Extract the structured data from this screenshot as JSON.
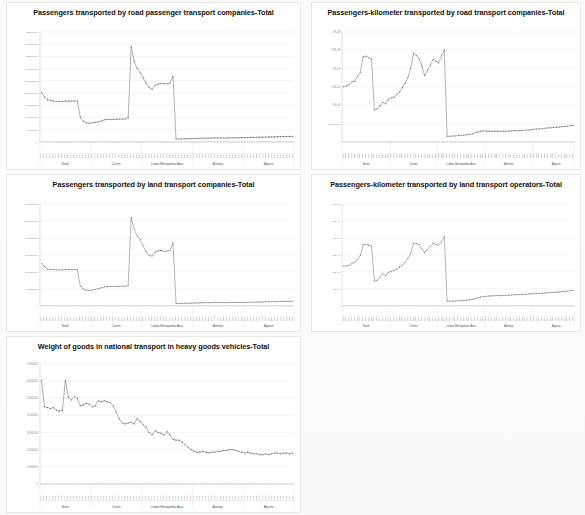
{
  "page": {
    "background_color": "#fbfbfa",
    "layout": "2-column grid of line charts, 5 charts total"
  },
  "regions": [
    "North",
    "Centro",
    "Lisbon Metropolitan Area",
    "Alentejo",
    "Algarve"
  ],
  "years": [
    "2002",
    "2003",
    "2004",
    "2005",
    "2006",
    "2007",
    "2008",
    "2009",
    "2010",
    "2011",
    "2012",
    "2013",
    "2014",
    "2015",
    "2016",
    "2017",
    "2018"
  ],
  "chart_data": [
    {
      "id": "chart-1",
      "type": "line",
      "title": "Passengers transported by road passenger transport companies-Total",
      "xlabel": "",
      "ylabel": "",
      "grid": true,
      "legend": "none",
      "series_color": "#6b6b6b",
      "ylim": [
        0,
        450000000
      ],
      "ytick_labels": [
        "0",
        "50000000",
        "100000000",
        "150000000",
        "200000000",
        "250000000",
        "300000000",
        "350000000",
        "400000000",
        "450000000"
      ],
      "ytick_values": [
        0,
        50000000,
        100000000,
        150000000,
        200000000,
        250000000,
        300000000,
        350000000,
        400000000,
        450000000
      ],
      "group_labels": [
        "North",
        "Centro",
        "Lisbon Metropolitan Area",
        "Alentejo",
        "Algarve"
      ],
      "x": [
        "2002",
        "2003",
        "2004",
        "2005",
        "2006",
        "2007",
        "2008",
        "2009",
        "2010",
        "2011",
        "2012",
        "2013",
        "2014",
        "2015",
        "2016",
        "2017",
        "2018",
        "2002",
        "2003",
        "2004",
        "2005",
        "2006",
        "2007",
        "2008",
        "2009",
        "2010",
        "2011",
        "2012",
        "2013",
        "2014",
        "2015",
        "2016",
        "2017",
        "2018",
        "2002",
        "2003",
        "2004",
        "2005",
        "2006",
        "2007",
        "2008",
        "2009",
        "2010",
        "2011",
        "2012",
        "2013",
        "2014",
        "2015",
        "2016",
        "2017",
        "2018",
        "2002",
        "2003",
        "2004",
        "2005",
        "2006",
        "2007",
        "2008",
        "2009",
        "2010",
        "2011",
        "2012",
        "2013",
        "2014",
        "2015",
        "2016",
        "2017",
        "2018",
        "2002",
        "2003",
        "2004",
        "2005",
        "2006",
        "2007",
        "2008",
        "2009",
        "2010",
        "2011",
        "2012",
        "2013",
        "2014",
        "2015",
        "2016",
        "2017",
        "2018"
      ],
      "values": [
        202000000,
        183000000,
        172000000,
        170000000,
        167000000,
        165000000,
        166000000,
        166000000,
        167000000,
        166000000,
        167000000,
        167000000,
        167000000,
        100000000,
        84000000,
        78000000,
        76000000,
        78000000,
        80000000,
        82000000,
        85000000,
        90000000,
        91000000,
        91000000,
        92000000,
        92000000,
        93000000,
        93000000,
        93000000,
        98000000,
        390000000,
        330000000,
        300000000,
        283000000,
        262000000,
        240000000,
        222000000,
        215000000,
        232000000,
        237000000,
        240000000,
        238000000,
        238000000,
        240000000,
        268000000,
        12000000,
        11000000,
        12000000,
        12000000,
        12000000,
        13000000,
        13000000,
        14000000,
        14000000,
        15000000,
        15000000,
        15000000,
        15000000,
        16000000,
        16000000,
        16000000,
        15000000,
        15000000,
        16000000,
        16000000,
        16000000,
        16000000,
        17000000,
        17000000,
        17000000,
        18000000,
        18000000,
        18000000,
        19000000,
        19000000,
        19000000,
        20000000,
        20000000,
        20000000,
        21000000,
        21000000,
        21000000,
        22000000,
        22000000,
        22000000
      ]
    },
    {
      "id": "chart-2",
      "type": "line",
      "title": "Passengers-kilometer transported by road transport companies-Total",
      "xlabel": "",
      "ylabel": "",
      "grid": true,
      "legend": "none",
      "series_color": "#6b6b6b",
      "ylim": [
        0,
        3000000000
      ],
      "ytick_labels": [
        "0",
        "500000000",
        "1.E+09",
        "1.5E+09",
        "2.E+09",
        "2.5E+09",
        "3.E+09"
      ],
      "ytick_values": [
        0,
        500000000,
        1000000000,
        1500000000,
        2000000000,
        2500000000,
        3000000000
      ],
      "group_labels": [
        "North",
        "Centro",
        "Lisbon Metropolitan Area",
        "Alentejo",
        "Algarve"
      ],
      "values": [
        1500000000,
        1520000000,
        1560000000,
        1640000000,
        1650000000,
        1790000000,
        1900000000,
        2320000000,
        2340000000,
        2290000000,
        2260000000,
        870000000,
        900000000,
        980000000,
        1080000000,
        1040000000,
        1150000000,
        1200000000,
        1220000000,
        1290000000,
        1350000000,
        1480000000,
        1600000000,
        1760000000,
        2000000000,
        2420000000,
        2360000000,
        2260000000,
        2060000000,
        1800000000,
        1950000000,
        2080000000,
        2250000000,
        2200000000,
        2150000000,
        2350000000,
        2510000000,
        150000000,
        150000000,
        160000000,
        160000000,
        170000000,
        180000000,
        180000000,
        190000000,
        200000000,
        210000000,
        250000000,
        270000000,
        290000000,
        300000000,
        290000000,
        290000000,
        280000000,
        290000000,
        290000000,
        280000000,
        290000000,
        290000000,
        290000000,
        300000000,
        300000000,
        300000000,
        310000000,
        310000000,
        320000000,
        320000000,
        330000000,
        340000000,
        350000000,
        350000000,
        360000000,
        370000000,
        380000000,
        380000000,
        390000000,
        400000000,
        400000000,
        410000000,
        420000000,
        430000000,
        440000000,
        450000000
      ]
    },
    {
      "id": "chart-3",
      "type": "line",
      "title": "Passengers transported by land transport companies-Total",
      "xlabel": "",
      "ylabel": "",
      "grid": true,
      "legend": "none",
      "series_color": "#6b6b6b",
      "ylim": [
        0,
        600000000
      ],
      "ytick_labels": [
        "0",
        "100000000",
        "200000000",
        "300000000",
        "400000000",
        "500000000",
        "600000000"
      ],
      "ytick_values": [
        0,
        100000000,
        200000000,
        300000000,
        400000000,
        500000000,
        600000000
      ],
      "group_labels": [
        "North",
        "Centro",
        "Lisbon Metropolitan Area",
        "Alentejo",
        "Algarve"
      ],
      "values": [
        250000000,
        230000000,
        215000000,
        213000000,
        212000000,
        211000000,
        210000000,
        211000000,
        212000000,
        212000000,
        213000000,
        213000000,
        212000000,
        115000000,
        98000000,
        92000000,
        90000000,
        92000000,
        96000000,
        100000000,
        105000000,
        110000000,
        112000000,
        113000000,
        113000000,
        114000000,
        114000000,
        115000000,
        115000000,
        118000000,
        520000000,
        450000000,
        412000000,
        390000000,
        352000000,
        318000000,
        295000000,
        292000000,
        316000000,
        322000000,
        325000000,
        320000000,
        322000000,
        326000000,
        370000000,
        14000000,
        13000000,
        14000000,
        14000000,
        15000000,
        15000000,
        16000000,
        16000000,
        17000000,
        17000000,
        18000000,
        18000000,
        18000000,
        19000000,
        19000000,
        19000000,
        18000000,
        18000000,
        19000000,
        19000000,
        19000000,
        19000000,
        20000000,
        20000000,
        20000000,
        21000000,
        21000000,
        22000000,
        22000000,
        22000000,
        23000000,
        23000000,
        24000000,
        24000000,
        25000000,
        25000000,
        25000000,
        26000000,
        26000000,
        26000000
      ]
    },
    {
      "id": "chart-4",
      "type": "line",
      "title": "Passengers-kilometer transported by land transport operators-Total",
      "xlabel": "",
      "ylabel": "",
      "grid": true,
      "legend": "none",
      "series_color": "#6b6b6b",
      "ylim": [
        0,
        6000000000
      ],
      "ytick_labels": [
        "0",
        "1.E+09",
        "2.E+09",
        "3.E+09",
        "4.E+09",
        "5.E+09",
        "6.E+09"
      ],
      "ytick_values": [
        0,
        1000000000,
        2000000000,
        3000000000,
        4000000000,
        5000000000,
        6000000000
      ],
      "group_labels": [
        "North",
        "Centro",
        "Lisbon Metropolitan Area",
        "Alentejo",
        "Algarve"
      ],
      "values": [
        2350000000,
        2330000000,
        2370000000,
        2480000000,
        2560000000,
        2720000000,
        2960000000,
        3580000000,
        3620000000,
        3560000000,
        3510000000,
        1460000000,
        1490000000,
        1680000000,
        1890000000,
        1770000000,
        1960000000,
        2020000000,
        2080000000,
        2160000000,
        2280000000,
        2390000000,
        2540000000,
        2790000000,
        3080000000,
        3660000000,
        3680000000,
        3600000000,
        3350000000,
        3120000000,
        3320000000,
        3480000000,
        3670000000,
        3620000000,
        3560000000,
        3750000000,
        4080000000,
        260000000,
        260000000,
        270000000,
        280000000,
        290000000,
        300000000,
        310000000,
        320000000,
        340000000,
        370000000,
        420000000,
        470000000,
        510000000,
        540000000,
        560000000,
        570000000,
        580000000,
        590000000,
        600000000,
        590000000,
        600000000,
        610000000,
        620000000,
        630000000,
        640000000,
        650000000,
        660000000,
        670000000,
        680000000,
        690000000,
        700000000,
        710000000,
        720000000,
        730000000,
        740000000,
        750000000,
        760000000,
        770000000,
        780000000,
        800000000,
        810000000,
        820000000,
        840000000,
        860000000,
        880000000,
        900000000
      ]
    },
    {
      "id": "chart-5",
      "type": "line",
      "title": "Weight of goods in national transport in heavy goods vehicles-Total",
      "xlabel": "",
      "ylabel": "",
      "grid": true,
      "legend": "none",
      "series_color": "#6b6b6b",
      "ylim": [
        0,
        70000000
      ],
      "ytick_labels": [
        "0",
        "10000000",
        "20000000",
        "30000000",
        "40000000",
        "50000000",
        "60000000",
        "70000000"
      ],
      "ytick_values": [
        0,
        10000000,
        20000000,
        30000000,
        40000000,
        50000000,
        60000000,
        70000000
      ],
      "group_labels": [
        "North",
        "Centro",
        "Lisbon Metropolitan Area",
        "Alentejo",
        "Algarve"
      ],
      "values": [
        60500000,
        45000000,
        44500000,
        44000000,
        44500000,
        43000000,
        42500000,
        43000000,
        60500000,
        50500000,
        49000000,
        51000000,
        50000000,
        45500000,
        46000000,
        47000000,
        46500000,
        45000000,
        45500000,
        48500000,
        48000000,
        48500000,
        48000000,
        47500000,
        45500000,
        42000000,
        38000000,
        35500000,
        35000000,
        35500000,
        36000000,
        35000000,
        38000000,
        36500000,
        34500000,
        33000000,
        30000000,
        28500000,
        31000000,
        30000000,
        29500000,
        28500000,
        30500000,
        28500000,
        26000000,
        25500000,
        25500000,
        24500000,
        23000000,
        21500000,
        20000000,
        19000000,
        18500000,
        18500000,
        19000000,
        18500000,
        18000000,
        18500000,
        18500000,
        19000000,
        19000000,
        19500000,
        19500000,
        20000000,
        20000000,
        19500000,
        19000000,
        18500000,
        18000000,
        18500000,
        18000000,
        17500000,
        17500000,
        17000000,
        17000000,
        17500000,
        17000000,
        17500000,
        18000000,
        18000000,
        17500000,
        18000000,
        18000000,
        17500000,
        18000000
      ]
    }
  ]
}
